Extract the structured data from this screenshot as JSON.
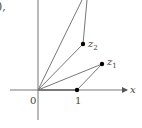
{
  "diagram": {
    "caption_fragment": "),",
    "axis_label_x": "x",
    "origin_label": "0",
    "unit_label": "1",
    "points": [
      {
        "name": "z",
        "subscript": "1"
      },
      {
        "name": "z",
        "subscript": "2"
      }
    ],
    "colors": {
      "line": "#777777",
      "point": "#000000",
      "text": "#444444"
    }
  }
}
